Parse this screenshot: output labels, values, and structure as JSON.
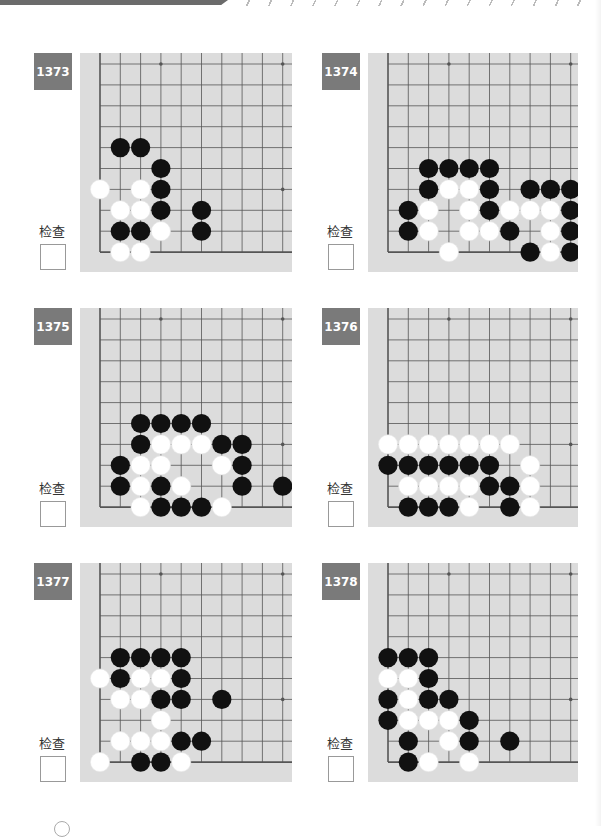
{
  "header": {
    "decor": "top-band-hatched"
  },
  "check_label": "检查",
  "colors": {
    "board": "#dcdcdc",
    "line": "#555555",
    "badge": "#7a7a7a",
    "black": "#111111",
    "white": "#ffffff"
  },
  "problems": [
    {
      "number": "1373",
      "black": [
        [
          1,
          4
        ],
        [
          2,
          4
        ],
        [
          3,
          5
        ],
        [
          3,
          6
        ],
        [
          3,
          7
        ],
        [
          5,
          7
        ],
        [
          1,
          8
        ],
        [
          2,
          8
        ],
        [
          5,
          8
        ]
      ],
      "white": [
        [
          0,
          6
        ],
        [
          2,
          6
        ],
        [
          1,
          7
        ],
        [
          2,
          7
        ],
        [
          3,
          8
        ],
        [
          1,
          9
        ],
        [
          2,
          9
        ]
      ]
    },
    {
      "number": "1374",
      "black": [
        [
          2,
          5
        ],
        [
          3,
          5
        ],
        [
          4,
          5
        ],
        [
          5,
          5
        ],
        [
          2,
          6
        ],
        [
          5,
          6
        ],
        [
          7,
          6
        ],
        [
          8,
          6
        ],
        [
          9,
          6
        ],
        [
          1,
          7
        ],
        [
          5,
          7
        ],
        [
          9,
          7
        ],
        [
          1,
          8
        ],
        [
          6,
          8
        ],
        [
          9,
          8
        ],
        [
          7,
          9
        ],
        [
          9,
          9
        ]
      ],
      "white": [
        [
          3,
          6
        ],
        [
          4,
          6
        ],
        [
          2,
          7
        ],
        [
          4,
          7
        ],
        [
          6,
          7
        ],
        [
          7,
          7
        ],
        [
          8,
          7
        ],
        [
          2,
          8
        ],
        [
          4,
          8
        ],
        [
          5,
          8
        ],
        [
          8,
          8
        ],
        [
          3,
          9
        ],
        [
          8,
          9
        ]
      ]
    },
    {
      "number": "1375",
      "black": [
        [
          2,
          5
        ],
        [
          3,
          5
        ],
        [
          4,
          5
        ],
        [
          5,
          5
        ],
        [
          2,
          6
        ],
        [
          6,
          6
        ],
        [
          7,
          6
        ],
        [
          1,
          7
        ],
        [
          7,
          7
        ],
        [
          1,
          8
        ],
        [
          3,
          8
        ],
        [
          7,
          8
        ],
        [
          9,
          8
        ],
        [
          3,
          9
        ],
        [
          4,
          9
        ],
        [
          5,
          9
        ]
      ],
      "white": [
        [
          3,
          6
        ],
        [
          4,
          6
        ],
        [
          5,
          6
        ],
        [
          2,
          7
        ],
        [
          3,
          7
        ],
        [
          6,
          7
        ],
        [
          2,
          8
        ],
        [
          4,
          8
        ],
        [
          2,
          9
        ],
        [
          6,
          9
        ]
      ]
    },
    {
      "number": "1376",
      "black": [
        [
          0,
          7
        ],
        [
          1,
          7
        ],
        [
          2,
          7
        ],
        [
          3,
          7
        ],
        [
          4,
          7
        ],
        [
          5,
          7
        ],
        [
          5,
          8
        ],
        [
          6,
          8
        ],
        [
          1,
          9
        ],
        [
          2,
          9
        ],
        [
          3,
          9
        ],
        [
          6,
          9
        ]
      ],
      "white": [
        [
          0,
          6
        ],
        [
          1,
          6
        ],
        [
          2,
          6
        ],
        [
          3,
          6
        ],
        [
          4,
          6
        ],
        [
          5,
          6
        ],
        [
          6,
          6
        ],
        [
          7,
          7
        ],
        [
          1,
          8
        ],
        [
          2,
          8
        ],
        [
          3,
          8
        ],
        [
          4,
          8
        ],
        [
          7,
          8
        ],
        [
          4,
          9
        ],
        [
          7,
          9
        ]
      ]
    },
    {
      "number": "1377",
      "black": [
        [
          1,
          4
        ],
        [
          2,
          4
        ],
        [
          3,
          4
        ],
        [
          4,
          4
        ],
        [
          1,
          5
        ],
        [
          4,
          5
        ],
        [
          3,
          6
        ],
        [
          4,
          6
        ],
        [
          6,
          6
        ],
        [
          4,
          8
        ],
        [
          5,
          8
        ],
        [
          2,
          9
        ],
        [
          3,
          9
        ]
      ],
      "white": [
        [
          0,
          5
        ],
        [
          2,
          5
        ],
        [
          3,
          5
        ],
        [
          1,
          6
        ],
        [
          2,
          6
        ],
        [
          3,
          7
        ],
        [
          1,
          8
        ],
        [
          2,
          8
        ],
        [
          3,
          8
        ],
        [
          0,
          9
        ],
        [
          4,
          9
        ]
      ]
    },
    {
      "number": "1378",
      "black": [
        [
          0,
          4
        ],
        [
          1,
          4
        ],
        [
          2,
          4
        ],
        [
          2,
          5
        ],
        [
          0,
          6
        ],
        [
          2,
          6
        ],
        [
          3,
          6
        ],
        [
          0,
          7
        ],
        [
          4,
          7
        ],
        [
          1,
          8
        ],
        [
          4,
          8
        ],
        [
          6,
          8
        ],
        [
          1,
          9
        ]
      ],
      "white": [
        [
          0,
          5
        ],
        [
          1,
          5
        ],
        [
          1,
          6
        ],
        [
          1,
          7
        ],
        [
          2,
          7
        ],
        [
          3,
          7
        ],
        [
          3,
          8
        ],
        [
          2,
          9
        ],
        [
          4,
          9
        ]
      ]
    }
  ],
  "star_points": [
    [
      3,
      0
    ],
    [
      9,
      0
    ],
    [
      9,
      6
    ]
  ]
}
